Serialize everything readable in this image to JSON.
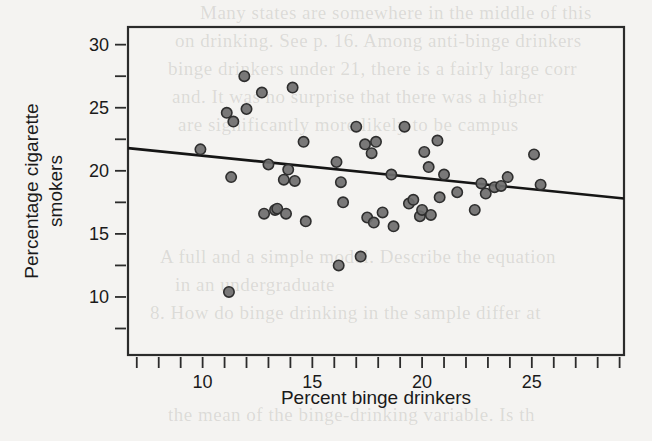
{
  "page": {
    "width": 652,
    "height": 441,
    "background_color": "#f4f3f1",
    "bleed_text": [
      "Many states are somewhere in the middle of this",
      "on drinking. See p. 16. Among anti-binge drinkers",
      "binge drinkers under 21, there is a fairly large corr",
      "and. It was no surprise that there was a higher",
      "are significantly more likely to be campus",
      "A full and a simple model. Describe the equation",
      "in an undergraduate",
      "8.  How do binge drinking in the sample differ at",
      "the mean of the binge-drinking variable. Is th"
    ]
  },
  "chart_data": {
    "type": "scatter",
    "title": "",
    "xlabel": "Percent binge drinkers",
    "ylabel_line1": "Percentage cigarette",
    "ylabel_line2": "smokers",
    "xlim": [
      6.6,
      29.2
    ],
    "ylim": [
      5.4,
      31.4
    ],
    "xticks_major": [
      10,
      15,
      20,
      25
    ],
    "xtick_labels": [
      "10",
      "15",
      "20",
      "25"
    ],
    "xticks_minor": [
      7,
      8,
      9,
      11,
      12,
      13,
      14,
      16,
      17,
      18,
      19,
      21,
      22,
      23,
      24,
      26,
      27,
      28,
      29
    ],
    "yticks_major": [
      10,
      15,
      20,
      25,
      30
    ],
    "ytick_labels": [
      "10",
      "15",
      "20",
      "25",
      "30"
    ],
    "yticks_minor": [
      7.5,
      12.5,
      17.5,
      22.5,
      27.5
    ],
    "grid": false,
    "legend": "none",
    "marker": {
      "shape": "circle",
      "radius": 5.2,
      "fill_color": "#6e6e6e",
      "edge_color": "#2e2e2e"
    },
    "trendline": {
      "type": "linear-fit",
      "color": "#151515",
      "x_start": 6.6,
      "y_start": 21.8,
      "x_end": 29.2,
      "y_end": 17.8,
      "slope": -0.177,
      "intercept": 22.97
    },
    "points": [
      {
        "x": 9.9,
        "y": 21.7
      },
      {
        "x": 11.1,
        "y": 24.6
      },
      {
        "x": 11.2,
        "y": 10.4
      },
      {
        "x": 11.3,
        "y": 19.5
      },
      {
        "x": 11.4,
        "y": 23.9
      },
      {
        "x": 11.9,
        "y": 27.5
      },
      {
        "x": 12.0,
        "y": 24.9
      },
      {
        "x": 12.7,
        "y": 26.2
      },
      {
        "x": 12.8,
        "y": 16.6
      },
      {
        "x": 13.0,
        "y": 20.5
      },
      {
        "x": 13.3,
        "y": 16.9
      },
      {
        "x": 13.4,
        "y": 17.0
      },
      {
        "x": 13.7,
        "y": 19.3
      },
      {
        "x": 13.8,
        "y": 16.6
      },
      {
        "x": 13.9,
        "y": 20.1
      },
      {
        "x": 14.1,
        "y": 26.6
      },
      {
        "x": 14.2,
        "y": 19.2
      },
      {
        "x": 14.6,
        "y": 22.3
      },
      {
        "x": 14.7,
        "y": 16.0
      },
      {
        "x": 16.1,
        "y": 20.7
      },
      {
        "x": 16.2,
        "y": 12.5
      },
      {
        "x": 16.3,
        "y": 19.1
      },
      {
        "x": 16.4,
        "y": 17.5
      },
      {
        "x": 17.0,
        "y": 23.5
      },
      {
        "x": 17.2,
        "y": 13.2
      },
      {
        "x": 17.4,
        "y": 22.1
      },
      {
        "x": 17.5,
        "y": 16.3
      },
      {
        "x": 17.7,
        "y": 21.4
      },
      {
        "x": 17.8,
        "y": 15.9
      },
      {
        "x": 17.9,
        "y": 22.3
      },
      {
        "x": 18.2,
        "y": 16.7
      },
      {
        "x": 18.6,
        "y": 19.7
      },
      {
        "x": 18.7,
        "y": 15.6
      },
      {
        "x": 19.2,
        "y": 23.5
      },
      {
        "x": 19.4,
        "y": 17.4
      },
      {
        "x": 19.6,
        "y": 17.7
      },
      {
        "x": 19.9,
        "y": 16.4
      },
      {
        "x": 20.0,
        "y": 16.9
      },
      {
        "x": 20.1,
        "y": 21.5
      },
      {
        "x": 20.3,
        "y": 20.3
      },
      {
        "x": 20.4,
        "y": 16.5
      },
      {
        "x": 20.7,
        "y": 22.4
      },
      {
        "x": 20.8,
        "y": 17.9
      },
      {
        "x": 21.0,
        "y": 19.7
      },
      {
        "x": 21.6,
        "y": 18.3
      },
      {
        "x": 22.4,
        "y": 16.9
      },
      {
        "x": 22.7,
        "y": 19.0
      },
      {
        "x": 22.9,
        "y": 18.2
      },
      {
        "x": 23.3,
        "y": 18.7
      },
      {
        "x": 23.6,
        "y": 18.8
      },
      {
        "x": 23.9,
        "y": 19.5
      },
      {
        "x": 25.1,
        "y": 21.3
      },
      {
        "x": 25.4,
        "y": 18.9
      }
    ]
  }
}
